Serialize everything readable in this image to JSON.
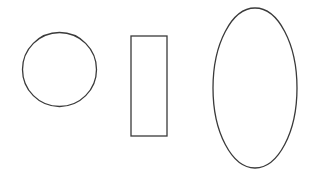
{
  "canvas": {
    "width": 310,
    "height": 182,
    "background": "#ffffff"
  },
  "stroke": {
    "color": "#3a3a3a",
    "width": 1.3
  },
  "shapes": {
    "circle": {
      "cx": 59.5,
      "cy": 69.5,
      "r": 37
    },
    "rectangle": {
      "x": 131,
      "y": 36,
      "width": 36,
      "height": 100
    },
    "ellipse": {
      "cx": 255,
      "cy": 88,
      "rx": 42,
      "ry": 80
    }
  }
}
